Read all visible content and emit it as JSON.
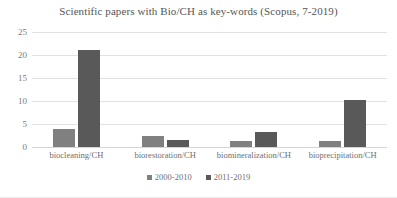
{
  "chart_data": {
    "type": "bar",
    "title": "Scientific papers with Bio/CH as key-words  (Scopus, 7-2019)",
    "xlabel": "",
    "ylabel": "",
    "ylim": [
      0,
      25
    ],
    "yticks": [
      0,
      5,
      10,
      15,
      20,
      25
    ],
    "grid": true,
    "legend_position": "bottom",
    "categories": [
      "biocleaning/CH",
      "biorestoration/CH",
      "biomineralization/CH",
      "bioprecipitation/CH"
    ],
    "series": [
      {
        "name": "2000-2010",
        "color": "#808080",
        "values": [
          4,
          2.5,
          1.3,
          1.2
        ]
      },
      {
        "name": "2011-2019",
        "color": "#595959",
        "values": [
          21,
          1.5,
          3.3,
          10.3
        ]
      }
    ]
  },
  "style": {
    "title_color": "#555555",
    "tick_color": "#7b7b7b",
    "label_color": "#6f6f6f",
    "gridline_color": "#e2e2e2",
    "background": "#ffffff"
  }
}
